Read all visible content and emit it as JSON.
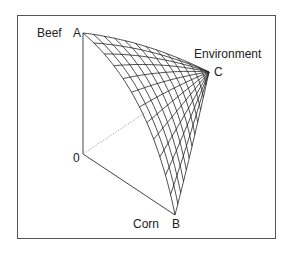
{
  "figure": {
    "axis_labels": {
      "beef": "Beef",
      "environment": "Environment",
      "corn": "Corn"
    },
    "vertices": {
      "a": "A",
      "b": "B",
      "c": "C",
      "origin": "0"
    },
    "colors": {
      "line": "#222222",
      "frame": "#555555",
      "dashed": "#888888",
      "background": "#ffffff"
    },
    "mesh": {
      "divisions": 12
    }
  }
}
